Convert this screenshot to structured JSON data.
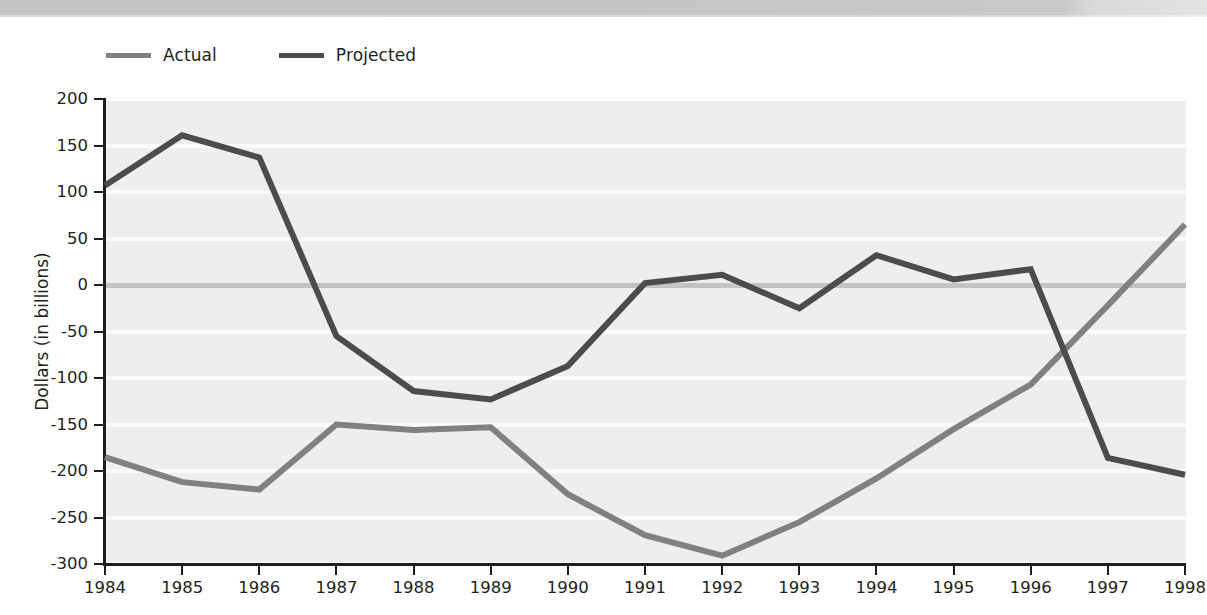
{
  "page": {
    "background": "#ffffff",
    "scan_band_color": "#c5c6c8"
  },
  "legend": {
    "position": "above-plot-left",
    "items": [
      {
        "label": "Actual",
        "color": "#7f8080",
        "icon": "line-swatch"
      },
      {
        "label": "Projected",
        "color": "#4b4c4d",
        "icon": "line-swatch"
      }
    ]
  },
  "axes": {
    "y": {
      "title": "Dollars (in billions)",
      "ticks": [
        200,
        150,
        100,
        50,
        0,
        -50,
        -100,
        -150,
        -200,
        -250,
        -300
      ],
      "tick_labels": [
        "200",
        "150",
        "100",
        "50",
        "0",
        "-50",
        "-100",
        "-150",
        "-200",
        "-250",
        "-300"
      ],
      "min": -300,
      "max": 200
    },
    "x": {
      "title": "",
      "tick_labels": [
        "1984",
        "1985",
        "1986",
        "1987",
        "1988",
        "1989",
        "1990",
        "1991",
        "1992",
        "1993",
        "1994",
        "1995",
        "1996",
        "1997",
        "1998"
      ]
    }
  },
  "style": {
    "plot_background": "#edeeee",
    "gridline_color": "#fbfbfb",
    "zero_line_color": "#c2c3c4",
    "axis_color": "#1d1d1d"
  },
  "chart_data": {
    "type": "line",
    "title": "",
    "subtitle": "",
    "xlabel": "",
    "ylabel": "Dollars (in billions)",
    "xlim": [
      "1984",
      "1998"
    ],
    "ylim": [
      -300,
      200
    ],
    "ytick_step": 50,
    "grid": true,
    "grid_axis": "y",
    "legend_position": "top-left",
    "x": [
      1984,
      1985,
      1986,
      1987,
      1988,
      1989,
      1990,
      1991,
      1992,
      1993,
      1994,
      1995,
      1996,
      1997,
      1998
    ],
    "categories": [
      "1984",
      "1985",
      "1986",
      "1987",
      "1988",
      "1989",
      "1990",
      "1991",
      "1992",
      "1993",
      "1994",
      "1995",
      "1996",
      "1997",
      "1998"
    ],
    "series": [
      {
        "name": "Actual",
        "color": "#7f8080",
        "values": [
          -185,
          -212,
          -220,
          -150,
          -156,
          -153,
          -225,
          -269,
          -291,
          -255,
          -208,
          -155,
          -107,
          -22,
          65
        ]
      },
      {
        "name": "Projected",
        "color": "#4b4c4d",
        "values": [
          107,
          161,
          137,
          -55,
          -114,
          -123,
          -87,
          2,
          11,
          -25,
          32,
          6,
          17,
          -186,
          -204
        ]
      }
    ]
  }
}
